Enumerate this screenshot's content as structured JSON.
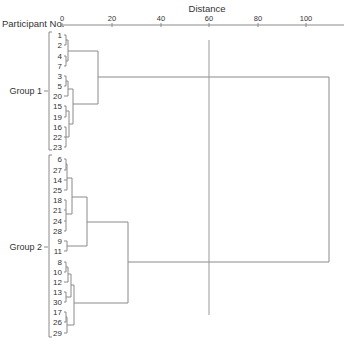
{
  "chart_data": {
    "type": "dendrogram",
    "title": "",
    "xlabel": "Distance",
    "ylabel": "Participant No.",
    "xlim": [
      0,
      115
    ],
    "x_ticks": [
      0,
      20,
      40,
      60,
      80,
      100
    ],
    "cut_line_distance": 60,
    "leaf_order": [
      "1",
      "2",
      "4",
      "7",
      "3",
      "5",
      "20",
      "15",
      "19",
      "16",
      "22",
      "23",
      "6",
      "27",
      "14",
      "25",
      "18",
      "21",
      "24",
      "28",
      "9",
      "11",
      "8",
      "10",
      "12",
      "13",
      "30",
      "17",
      "26",
      "29"
    ],
    "groups": [
      {
        "name": "Group 1",
        "members": [
          "1",
          "2",
          "4",
          "7",
          "3",
          "5",
          "20",
          "15",
          "19",
          "16",
          "22",
          "23"
        ]
      },
      {
        "name": "Group 2",
        "members": [
          "6",
          "27",
          "14",
          "25",
          "18",
          "21",
          "24",
          "28",
          "9",
          "11",
          "8",
          "10",
          "12",
          "13",
          "30",
          "17",
          "26",
          "29"
        ]
      }
    ],
    "merges": [
      {
        "items": [
          "1",
          "2"
        ],
        "distance": 1.5
      },
      {
        "items": [
          "4",
          "7"
        ],
        "distance": 1.5
      },
      {
        "items": [
          "1-2",
          "4-7"
        ],
        "distance": 2.5
      },
      {
        "items": [
          "3",
          "5"
        ],
        "distance": 1.5
      },
      {
        "items": [
          "3-5",
          "20"
        ],
        "distance": 2.5
      },
      {
        "items": [
          "15",
          "19"
        ],
        "distance": 1.5
      },
      {
        "items": [
          "16",
          "22",
          "23"
        ],
        "distance": 1
      },
      {
        "items": [
          "15-19",
          "16-22-23"
        ],
        "distance": 2.5
      },
      {
        "items": [
          "3-5-20",
          "15-19-16-22-23"
        ],
        "distance": 4.5
      },
      {
        "items": [
          "1-2-4-7",
          "3-5-20-15-19-16-22-23"
        ],
        "distance": 15
      },
      {
        "items": [
          "6",
          "27"
        ],
        "distance": 1
      },
      {
        "items": [
          "6-27",
          "14",
          "25"
        ],
        "distance": 2
      },
      {
        "items": [
          "18",
          "21",
          "24"
        ],
        "distance": 1
      },
      {
        "items": [
          "18-21-24",
          "28"
        ],
        "distance": 1
      },
      {
        "items": [
          "6-27-14-25",
          "18-21-24-28"
        ],
        "distance": 5.5
      },
      {
        "items": [
          "9",
          "11"
        ],
        "distance": 2
      },
      {
        "items": [
          "cluster-6..28",
          "9-11"
        ],
        "distance": 10
      },
      {
        "items": [
          "8",
          "10"
        ],
        "distance": 1.5
      },
      {
        "items": [
          "8-10",
          "12"
        ],
        "distance": 2
      },
      {
        "items": [
          "13",
          "30"
        ],
        "distance": 1.5
      },
      {
        "items": [
          "8-10-12",
          "13-30"
        ],
        "distance": 3
      },
      {
        "items": [
          "17",
          "26"
        ],
        "distance": 1.5
      },
      {
        "items": [
          "17-26",
          "29"
        ],
        "distance": 1
      },
      {
        "items": [
          "8-10-12-13-30",
          "17-26-29"
        ],
        "distance": 4
      },
      {
        "items": [
          "cluster-6..11",
          "cluster-8..29"
        ],
        "distance": 27
      },
      {
        "items": [
          "Group 1",
          "Group 2"
        ],
        "distance": 109
      }
    ]
  },
  "axis": {
    "title": "Distance",
    "row_label": "Participant No.",
    "ticks": [
      {
        "label": "0",
        "x": 62
      },
      {
        "label": "20",
        "x": 112
      },
      {
        "label": "40",
        "x": 161
      },
      {
        "label": "60",
        "x": 209
      },
      {
        "label": "80",
        "x": 258
      },
      {
        "label": "100",
        "x": 306
      }
    ]
  },
  "leaves": [
    {
      "label": "1",
      "y": 35
    },
    {
      "label": "2",
      "y": 45
    },
    {
      "label": "4",
      "y": 56
    },
    {
      "label": "7",
      "y": 66
    },
    {
      "label": "3",
      "y": 76
    },
    {
      "label": "5",
      "y": 86
    },
    {
      "label": "20",
      "y": 96
    },
    {
      "label": "15",
      "y": 106
    },
    {
      "label": "19",
      "y": 117
    },
    {
      "label": "16",
      "y": 127
    },
    {
      "label": "22",
      "y": 137
    },
    {
      "label": "23",
      "y": 147
    },
    {
      "label": "6",
      "y": 159
    },
    {
      "label": "27",
      "y": 170
    },
    {
      "label": "14",
      "y": 180
    },
    {
      "label": "25",
      "y": 190
    },
    {
      "label": "18",
      "y": 200
    },
    {
      "label": "21",
      "y": 210
    },
    {
      "label": "24",
      "y": 221
    },
    {
      "label": "28",
      "y": 231
    },
    {
      "label": "9",
      "y": 241
    },
    {
      "label": "11",
      "y": 251
    },
    {
      "label": "8",
      "y": 262
    },
    {
      "label": "10",
      "y": 272
    },
    {
      "label": "12",
      "y": 282
    },
    {
      "label": "13",
      "y": 292
    },
    {
      "label": "30",
      "y": 302
    },
    {
      "label": "17",
      "y": 312
    },
    {
      "label": "26",
      "y": 322
    },
    {
      "label": "29",
      "y": 333
    }
  ],
  "group_labels": [
    {
      "label": "Group 1",
      "y": 91
    },
    {
      "label": "Group 2",
      "y": 247
    }
  ],
  "colors": {
    "line": "#8a8a8a",
    "text": "#333333",
    "cut_line": "#999999"
  }
}
